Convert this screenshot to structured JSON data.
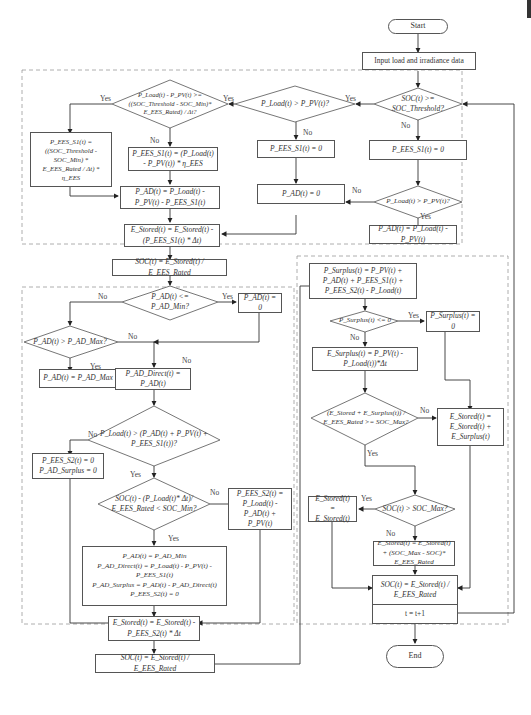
{
  "flowchart": {
    "start": "Start",
    "end": "End",
    "input": "Input load and irradiance data",
    "block1": {
      "d_soc_threshold": "SOC(t) >= SOC_Threshold?",
      "d_load_gt_pv_a": "P_Load(t) > P_PV(t)?",
      "d_load_minus_pv": "P_Load(t) - P_PV(t) >= ((SOC_Threshold - SOC_Min)* E_EES_Rated) / Δt?",
      "b_pees_s1_big": "P_EES_S1(t) = ((SOC_Threshold - SOC_Min) * E_EES_Rated / Δt) * η_EES",
      "b_pees_s1_eta": "P_EES_S1(t) = (P_Load(t) - P_PV(t)) * η_EES",
      "b_pad_calc": "P_AD(t) = P_Load(t) - P_PV(t) - P_EES_S1(t)",
      "b_estored": "E_Stored(t) = E_Stored(t) - (P_EES_S1(t) * Δt)",
      "b_pees_s1_zero_a": "P_EES_S1(t) = 0",
      "b_pad_zero_a": "P_AD(t) = 0",
      "b_pees_s1_zero_b": "P_EES_S1(t) = 0",
      "d_load_gt_pv_b": "P_Load(t) > P_PV(t)?",
      "b_pad_load_pv": "P_AD(t) = P_Load(t) - P_PV(t)"
    },
    "soc_update_1": "SOC(t) = E_Stored(t) / E_EES_Rated",
    "block2": {
      "d_pad_le_min": "P_AD(t) <= P_AD_Min?",
      "b_pad_zero": "P_AD(t) = 0",
      "d_pad_gt_max": "P_AD(t) > P_AD_Max?",
      "b_pad_max": "P_AD(t) = P_AD_Max",
      "b_pad_direct": "P_AD_Direct(t) = P_AD(t)",
      "d_load_gt_sum": "P_Load(t) > (P_AD(t) + P_PV(t) + P_EES_S1(t))?",
      "b_pees_s2_zero": "P_EES_S2(t) = 0\nP_AD_Surplus = 0",
      "d_soc_min": "SOC(t) - (P_Load(t)* Δt)/ E_EES_Rated < SOC_Min?",
      "b_pees_s2_calc": "P_EES_S2(t) = P_Load(t) - P_AD(t) + P_PV(t)",
      "b_pad_min_block": "P_AD(t) = P_AD_Min\nP_AD_Direct(t) = P_Load(t) - P_PV(t) - P_EES_S1(t)\nP_AD_Surplus = P_AD(t) - P_AD_Direct(t)\nP_EES_S2(t) = 0",
      "b_estored_s2": "E_Stored(t) = E_Stored(t) - P_EES_S2(t) * Δt"
    },
    "soc_update_2": "SOC(t) = E_Stored(t) / E_EES_Rated",
    "block3": {
      "b_psurplus_calc": "P_Surplus(t) = P_PV(t) + P_AD(t) + P_EES_S1(t) + P_EES_S2(t) - P_Load(t)",
      "d_psurplus_le_zero": "P_Surplus(t) <= 0",
      "b_psurplus_zero": "P_Surplus(t) = 0",
      "b_esurplus": "E_Surplus(t) = P_PV(t) - P_Load(t))*Δt",
      "d_soc_max_check": "(E_Stored + E_Surplus(t)) / E_EES_Rated >= SOC_Max?",
      "b_estored_add": "E_Stored(t) = E_Stored(t) + E_Surplus(t)",
      "d_soc_gt_max": "SOC(t) > SOC_Max?",
      "b_estored_same": "E_Stored(t) = E_Stored(t)",
      "b_estored_cap": "E_Stored(t) = E_Stored(t) + (SOC_Max - SOC)* E_EES_Rated"
    },
    "soc_update_3": "SOC(t) = E_Stored(t) / E_EES_Rated",
    "increment": "t = t+1",
    "labels": {
      "yes": "Yes",
      "no": "No"
    }
  }
}
